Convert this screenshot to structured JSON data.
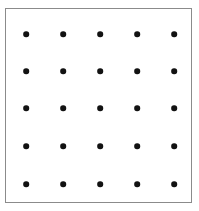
{
  "figure": {
    "kind": "dot-lattice-diagram",
    "title": "",
    "canvas": {
      "width": 199,
      "height": 211,
      "background_color": "#ffffff"
    },
    "frame": {
      "x": 5,
      "y": 8,
      "width": 187,
      "height": 195,
      "border_color": "#8b8b8b",
      "border_width": 1.4,
      "fill_color": "#ffffff"
    },
    "dot_style": {
      "color": "#121212",
      "diameter": 5.6,
      "shape": "circle"
    }
  },
  "chart_data": {
    "type": "scatter",
    "title": "",
    "xlabel": "",
    "ylabel": "",
    "grid": false,
    "legend": null,
    "rows": 5,
    "columns": 5,
    "point_count": 25,
    "marker": "circle",
    "marker_color": "#121212",
    "marker_size": 5.6,
    "xlim": [
      0,
      187
    ],
    "ylim": [
      0,
      195
    ],
    "x_tick_labels": [],
    "y_tick_labels": [],
    "column_centers_px": [
      20,
      57,
      94,
      131,
      168
    ],
    "row_centers_px": [
      25,
      62,
      99,
      137,
      175
    ],
    "x": [
      20,
      57,
      94,
      131,
      168,
      20,
      57,
      94,
      131,
      168,
      20,
      57,
      94,
      131,
      168,
      20,
      57,
      94,
      131,
      168,
      20,
      57,
      94,
      131,
      168
    ],
    "y": [
      25,
      25,
      25,
      25,
      25,
      62,
      62,
      62,
      62,
      62,
      99,
      99,
      99,
      99,
      99,
      137,
      137,
      137,
      137,
      137,
      175,
      175,
      175,
      175,
      175
    ],
    "points": [
      {
        "row": 1,
        "col": 1,
        "x": 20,
        "y": 25
      },
      {
        "row": 1,
        "col": 2,
        "x": 57,
        "y": 25
      },
      {
        "row": 1,
        "col": 3,
        "x": 94,
        "y": 25
      },
      {
        "row": 1,
        "col": 4,
        "x": 131,
        "y": 25
      },
      {
        "row": 1,
        "col": 5,
        "x": 168,
        "y": 25
      },
      {
        "row": 2,
        "col": 1,
        "x": 20,
        "y": 62
      },
      {
        "row": 2,
        "col": 2,
        "x": 57,
        "y": 62
      },
      {
        "row": 2,
        "col": 3,
        "x": 94,
        "y": 62
      },
      {
        "row": 2,
        "col": 4,
        "x": 131,
        "y": 62
      },
      {
        "row": 2,
        "col": 5,
        "x": 168,
        "y": 62
      },
      {
        "row": 3,
        "col": 1,
        "x": 20,
        "y": 99
      },
      {
        "row": 3,
        "col": 2,
        "x": 57,
        "y": 99
      },
      {
        "row": 3,
        "col": 3,
        "x": 94,
        "y": 99
      },
      {
        "row": 3,
        "col": 4,
        "x": 131,
        "y": 99
      },
      {
        "row": 3,
        "col": 5,
        "x": 168,
        "y": 99
      },
      {
        "row": 4,
        "col": 1,
        "x": 20,
        "y": 137
      },
      {
        "row": 4,
        "col": 2,
        "x": 57,
        "y": 137
      },
      {
        "row": 4,
        "col": 3,
        "x": 94,
        "y": 137
      },
      {
        "row": 4,
        "col": 4,
        "x": 131,
        "y": 137
      },
      {
        "row": 4,
        "col": 5,
        "x": 168,
        "y": 137
      },
      {
        "row": 5,
        "col": 1,
        "x": 20,
        "y": 175
      },
      {
        "row": 5,
        "col": 2,
        "x": 57,
        "y": 175
      },
      {
        "row": 5,
        "col": 3,
        "x": 94,
        "y": 175
      },
      {
        "row": 5,
        "col": 4,
        "x": 131,
        "y": 175
      },
      {
        "row": 5,
        "col": 5,
        "x": 168,
        "y": 175
      }
    ]
  }
}
